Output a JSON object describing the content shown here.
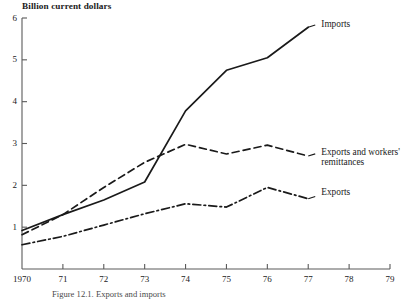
{
  "figure": {
    "y_axis_title": "Billion current dollars",
    "caption": "Figure 12.1. Exports and imports"
  },
  "chart_data": {
    "type": "line",
    "title": "",
    "subtitle": "",
    "xlabel": "",
    "ylabel": "Billion current dollars",
    "xlim": [
      1970,
      1979
    ],
    "ylim": [
      0,
      6
    ],
    "grid": false,
    "legend_position": "right-of-line-ends",
    "x_tick_labels": [
      "1970",
      "71",
      "72",
      "73",
      "74",
      "75",
      "76",
      "77",
      "78",
      "79"
    ],
    "x_ticks": [
      1970,
      1971,
      1972,
      1973,
      1974,
      1975,
      1976,
      1977,
      1978,
      1979
    ],
    "y_tick_labels": [
      "1",
      "2",
      "3",
      "4",
      "5",
      "6"
    ],
    "y_ticks": [
      1,
      2,
      3,
      4,
      5,
      6
    ],
    "x": [
      1970,
      1971,
      1972,
      1973,
      1974,
      1975,
      1976,
      1977
    ],
    "series": [
      {
        "name": "Imports",
        "style": "solid",
        "color": "#1a1a1a",
        "values": [
          0.92,
          1.3,
          1.65,
          2.08,
          3.78,
          4.75,
          5.05,
          5.78
        ]
      },
      {
        "name": "Exports and workers' remittances",
        "style": "dashed",
        "color": "#1a1a1a",
        "values": [
          0.82,
          1.3,
          1.95,
          2.55,
          2.98,
          2.75,
          2.96,
          2.7
        ]
      },
      {
        "name": "Exports",
        "style": "dash-dot",
        "color": "#1a1a1a",
        "values": [
          0.58,
          0.78,
          1.05,
          1.32,
          1.56,
          1.48,
          1.95,
          1.68
        ]
      }
    ],
    "annotations": [
      {
        "text": "Imports",
        "x": 1977.1,
        "y": 5.85
      },
      {
        "text": "Exports and workers' remittances",
        "x": 1977.1,
        "y": 2.78
      },
      {
        "text": "Exports",
        "x": 1977.1,
        "y": 1.82
      }
    ]
  }
}
